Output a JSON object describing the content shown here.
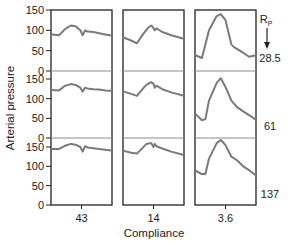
{
  "chart_data": {
    "type": "line",
    "title": "",
    "xlabel": "Compliance",
    "ylabel": "Arterial pressure",
    "legend_header": "R",
    "legend_header_sub": "P",
    "columns": [
      {
        "compliance": "43"
      },
      {
        "compliance": "14"
      },
      {
        "compliance": "3.6"
      }
    ],
    "rows": [
      {
        "rp": "28.5"
      },
      {
        "rp": "61"
      },
      {
        "rp": "137"
      }
    ],
    "y_ticks": [
      0,
      50,
      100,
      150
    ],
    "ylim": [
      0,
      150
    ],
    "grid": false,
    "line_color": "#7a7a7a",
    "series": [
      {
        "row": 0,
        "col": 0,
        "name": "C=43, Rp=28.5",
        "t": [
          0,
          0.12,
          0.22,
          0.32,
          0.4,
          0.48,
          0.52,
          0.56,
          0.6,
          0.7,
          0.8,
          0.9,
          1.0
        ],
        "values": [
          90,
          88,
          103,
          112,
          110,
          100,
          88,
          100,
          97,
          96,
          93,
          90,
          87
        ]
      },
      {
        "row": 0,
        "col": 1,
        "name": "C=14, Rp=28.5",
        "t": [
          0,
          0.12,
          0.22,
          0.32,
          0.4,
          0.46,
          0.48,
          0.52,
          0.55,
          0.65,
          0.8,
          1.0
        ],
        "values": [
          82,
          75,
          68,
          90,
          105,
          112,
          110,
          100,
          105,
          96,
          88,
          80
        ]
      },
      {
        "row": 0,
        "col": 2,
        "name": "C=3.6, Rp=28.5",
        "t": [
          0,
          0.1,
          0.16,
          0.22,
          0.35,
          0.42,
          0.5,
          0.6,
          0.65,
          0.8,
          0.9,
          1.0
        ],
        "values": [
          38,
          32,
          65,
          100,
          135,
          140,
          125,
          65,
          58,
          45,
          35,
          38
        ]
      },
      {
        "row": 1,
        "col": 0,
        "name": "C=43, Rp=61",
        "t": [
          0,
          0.12,
          0.22,
          0.32,
          0.4,
          0.48,
          0.52,
          0.56,
          0.6,
          0.7,
          0.8,
          0.9,
          1.0
        ],
        "values": [
          122,
          121,
          133,
          137,
          135,
          128,
          118,
          128,
          126,
          124,
          123,
          121,
          120
        ]
      },
      {
        "row": 1,
        "col": 1,
        "name": "C=14, Rp=61",
        "t": [
          0,
          0.12,
          0.22,
          0.3,
          0.38,
          0.46,
          0.5,
          0.52,
          0.55,
          0.65,
          0.8,
          1.0
        ],
        "values": [
          118,
          112,
          107,
          122,
          135,
          142,
          138,
          128,
          133,
          124,
          116,
          108
        ]
      },
      {
        "row": 1,
        "col": 2,
        "name": "C=3.6, Rp=61",
        "t": [
          0,
          0.1,
          0.16,
          0.22,
          0.35,
          0.42,
          0.5,
          0.6,
          0.7,
          0.8,
          0.9,
          1.0
        ],
        "values": [
          60,
          45,
          48,
          95,
          140,
          152,
          130,
          95,
          78,
          68,
          58,
          48
        ]
      },
      {
        "row": 2,
        "col": 0,
        "name": "C=43, Rp=137",
        "t": [
          0,
          0.12,
          0.22,
          0.32,
          0.4,
          0.48,
          0.52,
          0.56,
          0.6,
          0.7,
          0.8,
          0.9,
          1.0
        ],
        "values": [
          145,
          145,
          153,
          158,
          156,
          150,
          138,
          152,
          149,
          147,
          145,
          143,
          141
        ]
      },
      {
        "row": 2,
        "col": 1,
        "name": "C=14, Rp=137",
        "t": [
          0,
          0.12,
          0.22,
          0.3,
          0.38,
          0.46,
          0.5,
          0.52,
          0.55,
          0.65,
          0.8,
          1.0
        ],
        "values": [
          140,
          135,
          133,
          145,
          158,
          160,
          150,
          158,
          152,
          146,
          138,
          130
        ]
      },
      {
        "row": 2,
        "col": 2,
        "name": "C=3.6, Rp=137",
        "t": [
          0,
          0.1,
          0.16,
          0.22,
          0.35,
          0.42,
          0.5,
          0.6,
          0.7,
          0.8,
          0.9,
          1.0
        ],
        "values": [
          88,
          80,
          80,
          120,
          160,
          168,
          155,
          125,
          115,
          100,
          90,
          78
        ]
      }
    ]
  }
}
